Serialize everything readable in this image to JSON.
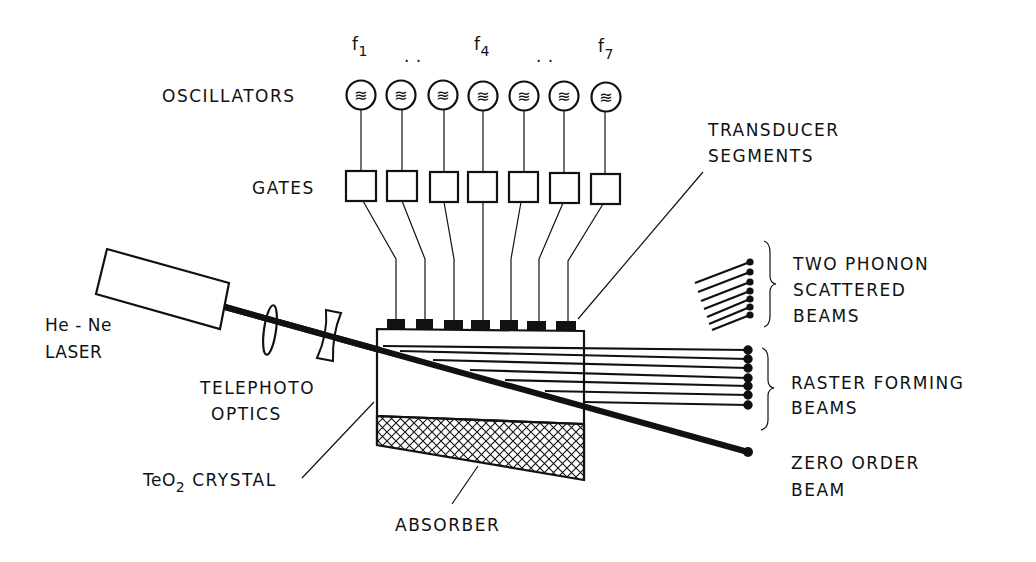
{
  "diagram": {
    "type": "acousto-optic raster scanner schematic",
    "frequency_labels": [
      {
        "text": "f",
        "sub": "1"
      },
      {
        "text": ". .",
        "sub": ""
      },
      {
        "text": "f",
        "sub": "4"
      },
      {
        "text": ". .",
        "sub": ""
      },
      {
        "text": "f",
        "sub": "7"
      }
    ],
    "labels": {
      "oscillators": "OSCILLATORS",
      "gates": "GATES",
      "transducer_line1": "TRANSDUCER",
      "transducer_line2": "SEGMENTS",
      "laser_line1": "He - Ne",
      "laser_line2": "LASER",
      "telephoto_line1": "TELEPHOTO",
      "telephoto_line2": "OPTICS",
      "crystal_prefix": "TeO",
      "crystal_sub": "2",
      "crystal_suffix": " CRYSTAL",
      "absorber": "ABSORBER",
      "two_phonon_line1": "TWO PHONON",
      "two_phonon_line2": "SCATTERED",
      "two_phonon_line3": "BEAMS",
      "raster_line1": "RASTER FORMING",
      "raster_line2": "BEAMS",
      "zero_order_line1": "ZERO ORDER",
      "zero_order_line2": "BEAM"
    },
    "oscillator_glyph": "≋",
    "channel_count": 7,
    "components": [
      "oscillators",
      "gates",
      "transducer-segments",
      "he-ne-laser",
      "telephoto-optics",
      "teo2-crystal",
      "absorber"
    ],
    "output_beams": [
      "two-phonon-scattered-beams",
      "raster-forming-beams",
      "zero-order-beam"
    ]
  }
}
